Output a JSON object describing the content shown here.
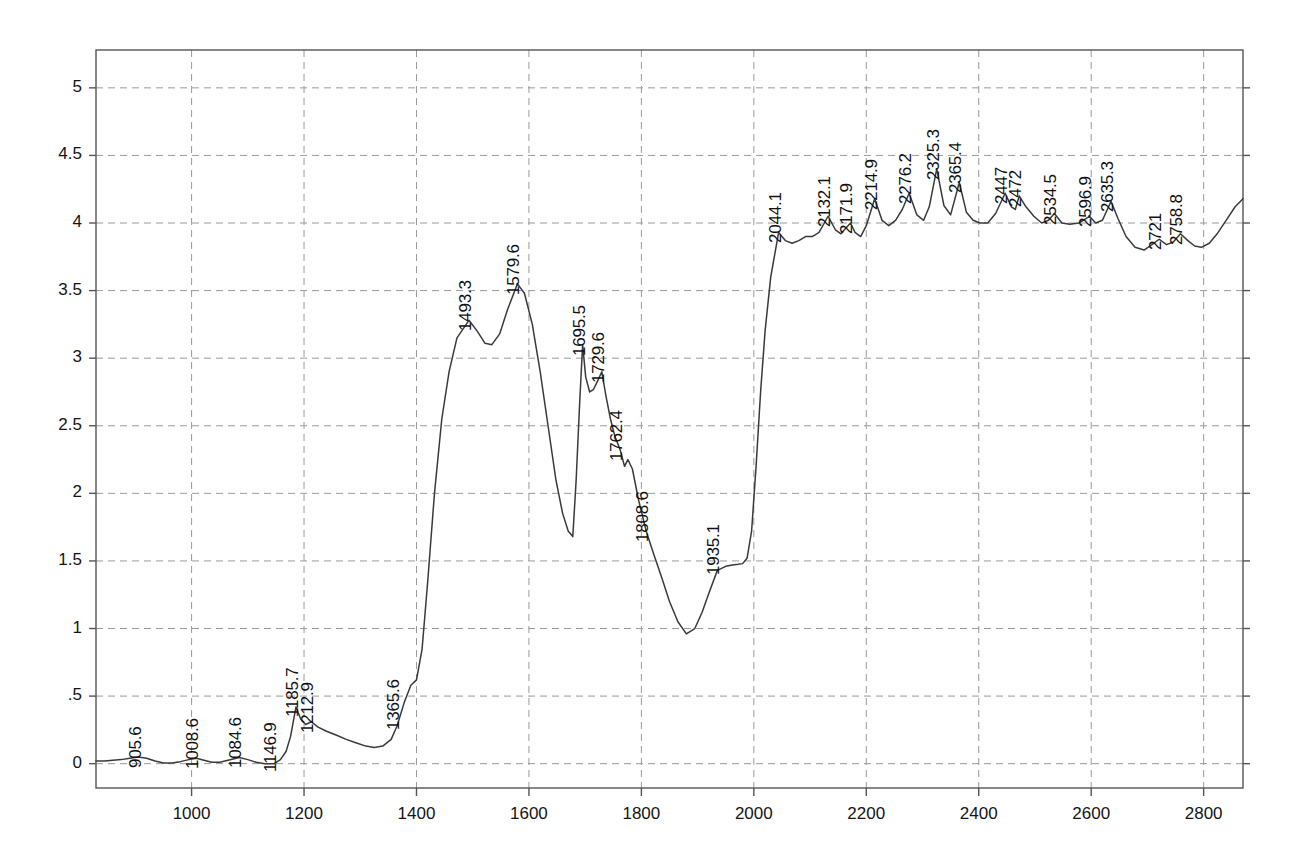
{
  "chart_data": {
    "type": "line",
    "title": "",
    "subtitle": "",
    "xlabel": "",
    "ylabel": "",
    "xlim": [
      830,
      2870
    ],
    "ylim": [
      -0.18,
      5.28
    ],
    "grid": true,
    "legend": false,
    "legend_position": "none",
    "line_color": "#3a3a3a",
    "grid_color": "#9a9a9a",
    "axis_color": "#555555",
    "text_color": "#141414",
    "xticks": [
      1000,
      1200,
      1400,
      1600,
      1800,
      2000,
      2200,
      2400,
      2600,
      2800
    ],
    "xtick_labels": [
      "1000",
      "1200",
      "1400",
      "1600",
      "1800",
      "2000",
      "2200",
      "2400",
      "2600",
      "2800"
    ],
    "yticks": [
      0,
      0.5,
      1,
      1.5,
      2,
      2.5,
      3,
      3.5,
      4,
      4.5,
      5
    ],
    "ytick_labels": [
      "0",
      ".5",
      "1",
      "1.5",
      "2",
      "2.5",
      "3",
      "3.5",
      "4",
      "4.5",
      "5"
    ],
    "annotations": [
      {
        "label": "905.6",
        "x": 905.6,
        "y": 0.05
      },
      {
        "label": "1008.6",
        "x": 1008.6,
        "y": 0.04
      },
      {
        "label": "1084.6",
        "x": 1084.6,
        "y": 0.05
      },
      {
        "label": "1146.9",
        "x": 1146.9,
        "y": 0.02
      },
      {
        "label": "1185.7",
        "x": 1185.7,
        "y": 0.43
      },
      {
        "label": "1212.9",
        "x": 1212.9,
        "y": 0.31
      },
      {
        "label": "1365.6",
        "x": 1365.6,
        "y": 0.33
      },
      {
        "label": "1493.3",
        "x": 1493.3,
        "y": 3.28
      },
      {
        "label": "1579.6",
        "x": 1579.6,
        "y": 3.55
      },
      {
        "label": "1695.5",
        "x": 1695.5,
        "y": 3.1
      },
      {
        "label": "1729.6",
        "x": 1729.6,
        "y": 2.9
      },
      {
        "label": "1762.4",
        "x": 1762.4,
        "y": 2.32
      },
      {
        "label": "1808.6",
        "x": 1808.6,
        "y": 1.72
      },
      {
        "label": "1935.1",
        "x": 1935.1,
        "y": 1.48
      },
      {
        "label": "2044.1",
        "x": 2044.1,
        "y": 3.93
      },
      {
        "label": "2132.1",
        "x": 2132.1,
        "y": 4.05
      },
      {
        "label": "2171.9",
        "x": 2171.9,
        "y": 4.0
      },
      {
        "label": "2214.9",
        "x": 2214.9,
        "y": 4.18
      },
      {
        "label": "2276.2",
        "x": 2276.2,
        "y": 4.22
      },
      {
        "label": "2325.3",
        "x": 2325.3,
        "y": 4.4
      },
      {
        "label": "2365.4",
        "x": 2365.4,
        "y": 4.3
      },
      {
        "label": "2447",
        "x": 2447.0,
        "y": 4.22
      },
      {
        "label": "2472",
        "x": 2472.0,
        "y": 4.2
      },
      {
        "label": "2534.5",
        "x": 2534.5,
        "y": 4.07
      },
      {
        "label": "2596.9",
        "x": 2596.9,
        "y": 4.05
      },
      {
        "label": "2635.3",
        "x": 2635.3,
        "y": 4.16
      },
      {
        "label": "2721",
        "x": 2721.0,
        "y": 3.88
      },
      {
        "label": "2758.8",
        "x": 2758.8,
        "y": 3.92
      }
    ],
    "x": [
      830,
      845,
      860,
      875,
      890,
      905.6,
      920,
      935,
      950,
      965,
      980,
      995,
      1008.6,
      1022,
      1036,
      1050,
      1065,
      1084.6,
      1100,
      1115,
      1130,
      1146.9,
      1158,
      1168,
      1176,
      1185.7,
      1194,
      1203,
      1212.9,
      1225,
      1240,
      1258,
      1275,
      1292,
      1310,
      1325,
      1340,
      1355,
      1365.6,
      1378,
      1390,
      1400,
      1410,
      1420,
      1432,
      1445,
      1458,
      1472,
      1493.3,
      1508,
      1522,
      1534,
      1548,
      1562,
      1579.6,
      1592,
      1606,
      1620,
      1634,
      1648,
      1660,
      1670,
      1678,
      1684,
      1690,
      1695.5,
      1701,
      1708,
      1715,
      1722,
      1729.6,
      1737,
      1745,
      1753,
      1762.4,
      1770,
      1776,
      1784,
      1795,
      1808.6,
      1822,
      1836,
      1850,
      1865,
      1880,
      1895,
      1908,
      1920,
      1935.1,
      1950,
      1962,
      1972,
      1980,
      1988,
      1996,
      2004,
      2012,
      2020,
      2030,
      2044.1,
      2056,
      2068,
      2080,
      2092,
      2104,
      2116,
      2132.1,
      2145,
      2155,
      2163,
      2171.9,
      2180,
      2190,
      2200,
      2214.9,
      2228,
      2240,
      2252,
      2264,
      2276.2,
      2290,
      2302,
      2312,
      2325.3,
      2338,
      2350,
      2365.4,
      2378,
      2390,
      2402,
      2416,
      2430,
      2447,
      2458,
      2465,
      2472,
      2484,
      2498,
      2512,
      2524,
      2534.5,
      2548,
      2562,
      2578,
      2590,
      2596.9,
      2608,
      2620,
      2635.3,
      2648,
      2662,
      2678,
      2694,
      2708,
      2721,
      2734,
      2746,
      2758.8,
      2772,
      2784,
      2796,
      2810,
      2824,
      2840,
      2856,
      2870
    ],
    "y": [
      0.02,
      0.02,
      0.025,
      0.03,
      0.04,
      0.05,
      0.04,
      0.02,
      0.005,
      0.005,
      0.015,
      0.03,
      0.04,
      0.025,
      0.01,
      0.01,
      0.025,
      0.045,
      0.03,
      0.01,
      0.0,
      0.0,
      0.03,
      0.09,
      0.2,
      0.42,
      0.33,
      0.29,
      0.31,
      0.27,
      0.24,
      0.21,
      0.18,
      0.155,
      0.13,
      0.12,
      0.13,
      0.18,
      0.28,
      0.45,
      0.58,
      0.62,
      0.85,
      1.35,
      2.0,
      2.55,
      2.9,
      3.15,
      3.28,
      3.2,
      3.11,
      3.1,
      3.18,
      3.36,
      3.55,
      3.48,
      3.25,
      2.9,
      2.5,
      2.1,
      1.85,
      1.72,
      1.68,
      2.1,
      2.65,
      3.1,
      2.86,
      2.75,
      2.77,
      2.83,
      2.9,
      2.72,
      2.55,
      2.42,
      2.32,
      2.2,
      2.25,
      2.18,
      1.95,
      1.72,
      1.55,
      1.38,
      1.2,
      1.05,
      0.96,
      1.0,
      1.12,
      1.26,
      1.43,
      1.46,
      1.47,
      1.475,
      1.48,
      1.52,
      1.72,
      2.2,
      2.75,
      3.2,
      3.6,
      3.93,
      3.87,
      3.85,
      3.87,
      3.9,
      3.9,
      3.93,
      4.05,
      3.95,
      3.92,
      3.96,
      4.0,
      3.93,
      3.9,
      3.98,
      4.18,
      4.02,
      3.98,
      4.02,
      4.1,
      4.22,
      4.06,
      4.02,
      4.12,
      4.4,
      4.13,
      4.06,
      4.3,
      4.08,
      4.02,
      4.0,
      4.0,
      4.07,
      4.22,
      4.12,
      4.1,
      4.2,
      4.12,
      4.05,
      4.0,
      4.02,
      4.07,
      4.0,
      3.99,
      4.0,
      4.03,
      4.05,
      4.0,
      4.02,
      4.16,
      4.03,
      3.9,
      3.82,
      3.8,
      3.84,
      3.88,
      3.84,
      3.86,
      3.92,
      3.87,
      3.83,
      3.82,
      3.85,
      3.92,
      4.02,
      4.12,
      4.18
    ]
  }
}
